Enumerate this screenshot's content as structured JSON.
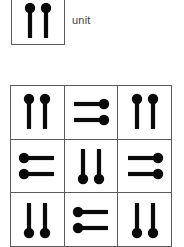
{
  "legend": {
    "label": "unit",
    "glyph": {
      "name": "double-pin-glyph",
      "rotation": 0,
      "description": "two vertical pins with round heads at the top"
    }
  },
  "matrix": {
    "rows": 3,
    "columns": 3,
    "cells": [
      {
        "row": 1,
        "column": 1,
        "rotation": 0,
        "glyph": "double-pin-glyph",
        "heads": "top"
      },
      {
        "row": 1,
        "column": 2,
        "rotation": 90,
        "glyph": "double-pin-glyph",
        "heads": "right"
      },
      {
        "row": 1,
        "column": 3,
        "rotation": 0,
        "glyph": "double-pin-glyph",
        "heads": "top"
      },
      {
        "row": 2,
        "column": 1,
        "rotation": 270,
        "glyph": "double-pin-glyph",
        "heads": "left"
      },
      {
        "row": 2,
        "column": 2,
        "rotation": 180,
        "glyph": "double-pin-glyph",
        "heads": "bottom"
      },
      {
        "row": 2,
        "column": 3,
        "rotation": 90,
        "glyph": "double-pin-glyph",
        "heads": "right"
      },
      {
        "row": 3,
        "column": 1,
        "rotation": 180,
        "glyph": "double-pin-glyph",
        "heads": "bottom"
      },
      {
        "row": 3,
        "column": 2,
        "rotation": 270,
        "glyph": "double-pin-glyph",
        "heads": "left"
      },
      {
        "row": 3,
        "column": 3,
        "rotation": 180,
        "glyph": "double-pin-glyph",
        "heads": "bottom"
      }
    ]
  },
  "colors": {
    "ink": "#0a0a0a",
    "grid_line": "#5a5a5a",
    "label_text": "#3c3c3c",
    "background": "#ffffff"
  }
}
